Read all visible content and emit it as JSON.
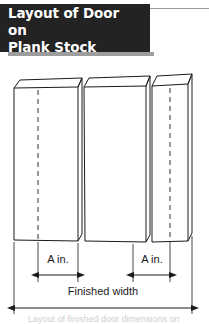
{
  "figure": {
    "title": "Layout of Door on\nPlank Stock",
    "accent_color": "#232323",
    "shadow_color": "#9d9d9d",
    "rule_color": "#9a9a9a",
    "line_color": "#1a1a1a",
    "background": "#ffffff"
  },
  "diagram": {
    "type": "technical-line-drawing",
    "plank_count": 3,
    "planks": [
      {
        "name": "plank-left",
        "centerline_label": "layout centerline"
      },
      {
        "name": "plank-middle",
        "centerline_label": ""
      },
      {
        "name": "plank-right",
        "centerline_label": "layout centerline"
      }
    ],
    "dimensions": [
      {
        "name": "dim-a-left",
        "label": "A in."
      },
      {
        "name": "dim-a-right",
        "label": "A in."
      },
      {
        "name": "dim-finished-width",
        "label": "Finished width"
      }
    ],
    "caption_partial": "Layout of finished door dimensions on"
  }
}
